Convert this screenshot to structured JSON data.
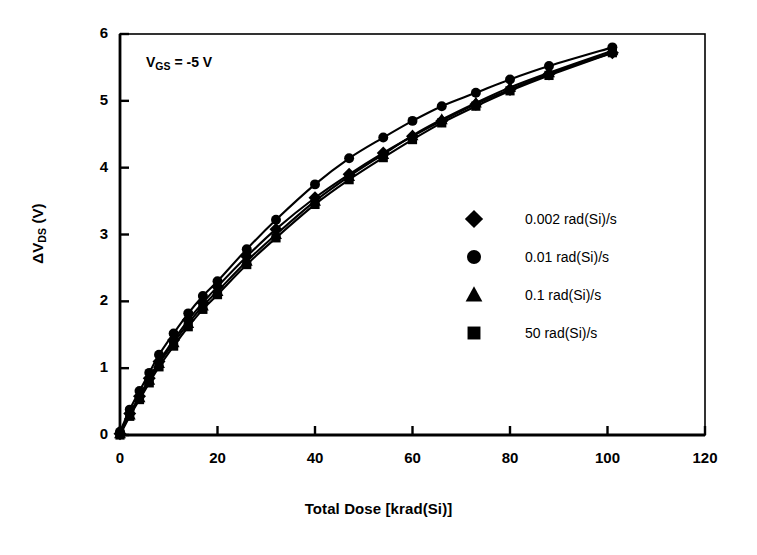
{
  "chart_data": {
    "type": "line",
    "title": "",
    "subtitle": "",
    "xlabel": "Total Dose [krad(Si)]",
    "ylabel": "ΔV_DS (V)",
    "ylabel_main": "ΔV",
    "ylabel_sub": "DS",
    "ylabel_unit": " (V)",
    "xlim": [
      0,
      120
    ],
    "ylim": [
      0,
      6
    ],
    "xticks": [
      0,
      20,
      40,
      60,
      80,
      100,
      120
    ],
    "yticks": [
      0,
      1,
      2,
      3,
      4,
      5,
      6
    ],
    "xtick_labels": [
      "0",
      "20",
      "40",
      "60",
      "80",
      "100",
      "120"
    ],
    "ytick_labels": [
      "0",
      "1",
      "2",
      "3",
      "4",
      "5",
      "6"
    ],
    "grid": false,
    "legend_position": "center-right",
    "marker_color": "#000000",
    "line_color": "#000000",
    "annotations": [
      {
        "name": "bias-condition",
        "text": "V_GS = -5 V",
        "text_main": "V",
        "text_sub": "GS",
        "text_tail": " = -5 V",
        "x": 8,
        "y": 5.45
      }
    ],
    "series": [
      {
        "name": "0.002 rad(Si)/s",
        "marker": "diamond",
        "label": "0.002 rad(Si)/s",
        "x": [
          0,
          2,
          4,
          6,
          8,
          11,
          14,
          17,
          20,
          26,
          32,
          40,
          47,
          54,
          60,
          66,
          73,
          80,
          88,
          101
        ],
        "y": [
          0.02,
          0.32,
          0.58,
          0.85,
          1.1,
          1.42,
          1.72,
          1.98,
          2.22,
          2.67,
          3.08,
          3.55,
          3.9,
          4.22,
          4.47,
          4.7,
          4.95,
          5.17,
          5.4,
          5.72
        ]
      },
      {
        "name": "0.01 rad(Si)/s",
        "marker": "circle",
        "label": "0.01 rad(Si)/s",
        "x": [
          0,
          2,
          4,
          6,
          8,
          11,
          14,
          17,
          20,
          26,
          32,
          40,
          47,
          54,
          60,
          66,
          73,
          80,
          88,
          101
        ],
        "y": [
          0.05,
          0.38,
          0.66,
          0.93,
          1.2,
          1.52,
          1.82,
          2.08,
          2.3,
          2.78,
          3.22,
          3.75,
          4.14,
          4.45,
          4.7,
          4.92,
          5.12,
          5.32,
          5.52,
          5.8
        ]
      },
      {
        "name": "0.1 rad(Si)/s",
        "marker": "triangle",
        "label": "0.1 rad(Si)/s",
        "x": [
          0,
          2,
          4,
          6,
          8,
          11,
          14,
          17,
          20,
          26,
          32,
          40,
          47,
          54,
          60,
          66,
          73,
          80,
          88,
          101
        ],
        "y": [
          0.02,
          0.3,
          0.56,
          0.82,
          1.07,
          1.38,
          1.67,
          1.93,
          2.15,
          2.6,
          3.0,
          3.5,
          3.87,
          4.2,
          4.48,
          4.72,
          4.97,
          5.2,
          5.42,
          5.75
        ]
      },
      {
        "name": "50 rad(Si)/s",
        "marker": "square",
        "label": "50 rad(Si)/s",
        "x": [
          0,
          2,
          4,
          6,
          8,
          11,
          14,
          17,
          20,
          26,
          32,
          40,
          47,
          54,
          60,
          66,
          73,
          80,
          88,
          101
        ],
        "y": [
          0.0,
          0.28,
          0.53,
          0.78,
          1.02,
          1.33,
          1.62,
          1.88,
          2.1,
          2.55,
          2.95,
          3.45,
          3.82,
          4.15,
          4.42,
          4.67,
          4.92,
          5.15,
          5.38,
          5.72
        ]
      }
    ]
  }
}
